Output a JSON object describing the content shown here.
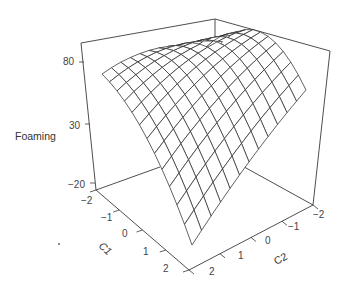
{
  "chart_data": {
    "type": "surface3d",
    "title": "",
    "zlabel": "Foaming",
    "xlabel": "C1",
    "ylabel": "C2",
    "x_ticks": [
      -2,
      -1,
      0,
      1,
      2
    ],
    "y_ticks": [
      -2,
      -1,
      0,
      1,
      2
    ],
    "z_ticks": [
      80,
      30,
      -20
    ],
    "xlim": [
      -2,
      2
    ],
    "ylim": [
      -2,
      2
    ],
    "zlim": [
      -20,
      95
    ],
    "grid_lines_per_axis": 13,
    "surface_model": "Foaming = 80 - 9*(C1+0.3)^2 - 8*(C2-0.3)^2 - 10*C1 - 6*C2",
    "surface_corners": {
      "C1=-2,C2=2": "high (left edge, ~60)",
      "C1=-2,C2=-2": "peak region ~85",
      "C1=2,C2=-2": "right edge ~65",
      "C1=2,C2=2": "minimum ~-10"
    },
    "style": {
      "line_color": "#333333",
      "background": "#ffffff",
      "box": true
    }
  },
  "labels": {
    "zlabel": "Foaming",
    "xlabel": "C1",
    "ylabel": "C2",
    "z_ticks": [
      "80",
      "30",
      "−20"
    ],
    "x_ticks": [
      "−2",
      "−1",
      "0",
      "1",
      "2"
    ],
    "y_ticks": [
      "2",
      "1",
      "0",
      "−1",
      "−2"
    ]
  }
}
